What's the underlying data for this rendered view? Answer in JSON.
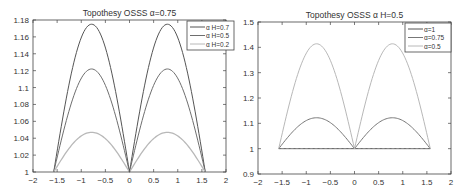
{
  "chart_data": [
    {
      "type": "line",
      "title": "Topothesy OSSS α=0.75",
      "xlabel": "",
      "ylabel": "",
      "xlim": [
        -2,
        2
      ],
      "ylim": [
        1,
        1.18
      ],
      "xticks": [
        -2,
        -1.5,
        -1,
        -0.5,
        0,
        0.5,
        1,
        1.5,
        2
      ],
      "xtick_labels": [
        "-2",
        "-1.5",
        "-1",
        "-0.5",
        "0",
        "0.5",
        "1",
        "1.5",
        "2"
      ],
      "yticks": [
        1,
        1.02,
        1.04,
        1.06,
        1.08,
        1.1,
        1.12,
        1.14,
        1.16,
        1.18
      ],
      "ytick_labels": [
        "1",
        "1.02",
        "1.04",
        "1.06",
        "1.08",
        "1.1",
        "1.12",
        "1.14",
        "1.16",
        "1.18"
      ],
      "grid": false,
      "legend_position": "upper right",
      "x": [
        -1.5708,
        -0.7854,
        0,
        0.7854,
        1.5708
      ],
      "series": [
        {
          "name": "α H=0.7",
          "peak": 1.175,
          "values": [
            1,
            1.175,
            1,
            1.175,
            1
          ],
          "color": "#555555"
        },
        {
          "name": "α H=0.5",
          "peak": 1.122,
          "values": [
            1,
            1.122,
            1,
            1.122,
            1
          ],
          "color": "#6e6e6e"
        },
        {
          "name": "α H=0.2",
          "peak": 1.047,
          "values": [
            1,
            1.047,
            1,
            1.047,
            1
          ],
          "color": "#b8b8b8"
        }
      ]
    },
    {
      "type": "line",
      "title": "Topothesy OSSS α H=0.5",
      "xlabel": "",
      "ylabel": "",
      "xlim": [
        -2,
        2
      ],
      "ylim": [
        0.9,
        1.5
      ],
      "xticks": [
        -2,
        -1.5,
        -1,
        -0.5,
        0,
        0.5,
        1,
        1.5,
        2
      ],
      "xtick_labels": [
        "-2",
        "-1.5",
        "-1",
        "-0.5",
        "0",
        "0.5",
        "1",
        "1.5",
        "2"
      ],
      "yticks": [
        0.9,
        1,
        1.1,
        1.2,
        1.3,
        1.4,
        1.5
      ],
      "ytick_labels": [
        "0.9",
        "1",
        "1.1",
        "1.2",
        "1.3",
        "1.4",
        "1.5"
      ],
      "grid": false,
      "legend_position": "upper right",
      "x": [
        -1.5708,
        -0.7854,
        0,
        0.7854,
        1.5708
      ],
      "series": [
        {
          "name": "α=1",
          "peak": 1.0,
          "values": [
            1,
            1,
            1,
            1,
            1
          ],
          "color": "#555555"
        },
        {
          "name": "α=0.75",
          "peak": 1.122,
          "values": [
            1,
            1.122,
            1,
            1.122,
            1
          ],
          "color": "#777777"
        },
        {
          "name": "α=0.5",
          "peak": 1.414,
          "values": [
            1,
            1.414,
            1,
            1.414,
            1
          ],
          "color": "#b8b8b8"
        }
      ]
    }
  ]
}
